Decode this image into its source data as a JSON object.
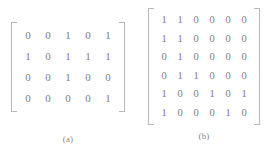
{
  "figure": {
    "background_color": "#ffffff",
    "digit_color": "#7d7d7d",
    "bracket_color": "#b9b9b9",
    "panels": [
      {
        "id": "a",
        "caption": "(a)",
        "rows": 4,
        "cols": 5,
        "matrix": [
          [
            "0",
            "0",
            "1",
            "0",
            "1"
          ],
          [
            "1",
            "0",
            "1",
            "1",
            "1"
          ],
          [
            "0",
            "0",
            "1",
            "0",
            "0"
          ],
          [
            "0",
            "0",
            "0",
            "0",
            "1"
          ]
        ]
      },
      {
        "id": "b",
        "caption": "(b)",
        "rows": 6,
        "cols": 6,
        "matrix": [
          [
            "1",
            "1",
            "0",
            "0",
            "0",
            "0"
          ],
          [
            "1",
            "1",
            "0",
            "0",
            "0",
            "0"
          ],
          [
            "0",
            "1",
            "0",
            "0",
            "0",
            "0"
          ],
          [
            "0",
            "1",
            "1",
            "0",
            "0",
            "0"
          ],
          [
            "1",
            "0",
            "0",
            "1",
            "0",
            "1"
          ],
          [
            "1",
            "0",
            "0",
            "0",
            "1",
            "0"
          ]
        ]
      }
    ]
  }
}
